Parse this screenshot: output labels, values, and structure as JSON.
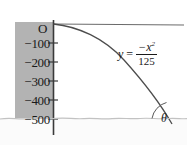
{
  "figure": {
    "origin_label": "O",
    "axis": {
      "name": "y-axis",
      "orientation": "vertical",
      "tick_labels": [
        "−100",
        "−200",
        "−300",
        "−400",
        "−500"
      ],
      "tick_values": [
        -100,
        -200,
        -300,
        -400,
        -500
      ],
      "band_color": "#b3b3b3"
    },
    "equation": {
      "lhs": "y",
      "equals": "=",
      "numerator": "−x",
      "numerator_exponent": "2",
      "denominator": "125",
      "plain": "y = −x²/125"
    },
    "angle": {
      "symbol": "θ",
      "name": "theta"
    },
    "curve": {
      "name": "parabola",
      "color": "#4d4d4d"
    },
    "horizontal_line": {
      "name": "horizontal-reference-line",
      "color": "#6b6b6b"
    },
    "water_line": {
      "name": "water-surface",
      "color": "#c8c8c8"
    }
  }
}
